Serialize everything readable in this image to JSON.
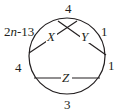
{
  "diagram": {
    "type": "circle-with-chords",
    "circle": {
      "cx": 67,
      "cy": 56,
      "r": 38
    },
    "stroke_color": "#231f20",
    "chords": [
      {
        "name": "X",
        "label": "X",
        "x1": 29,
        "y1": 53,
        "x2": 77,
        "y2": 21,
        "label_x": 47,
        "label_y": 41
      },
      {
        "name": "Y",
        "label": "Y",
        "x1": 58,
        "y1": 21,
        "x2": 106,
        "y2": 55,
        "label_x": 81,
        "label_y": 41
      },
      {
        "name": "Z",
        "label": "Z",
        "x1": 34,
        "y1": 78,
        "x2": 100,
        "y2": 78,
        "label_x": 62,
        "label_y": 82
      }
    ],
    "arc_labels": [
      {
        "position": "top",
        "text": "4",
        "x": 65,
        "y": 13
      },
      {
        "position": "upper-left",
        "text": "2n-13",
        "x": 4,
        "y": 36
      },
      {
        "position": "upper-right",
        "text": "1",
        "x": 101,
        "y": 36
      },
      {
        "position": "left",
        "text": "4",
        "x": 15,
        "y": 72
      },
      {
        "position": "right",
        "text": "1",
        "x": 108,
        "y": 70
      },
      {
        "position": "bottom",
        "text": "3",
        "x": 64,
        "y": 109
      }
    ]
  }
}
